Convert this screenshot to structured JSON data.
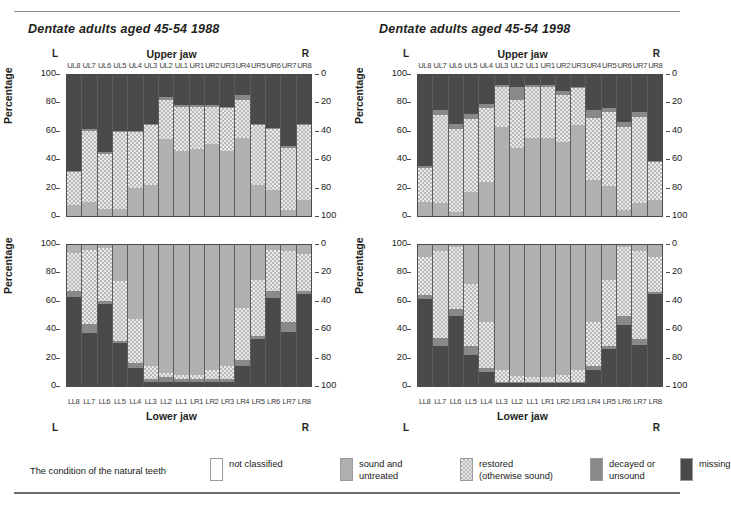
{
  "page": {
    "ghost_header": "",
    "legend_caption": "The condition of the natural teeth"
  },
  "panels": {
    "left": {
      "title": "Dentate adults aged 45-54 1988"
    },
    "right": {
      "title": "Dentate adults aged 45-54 1998"
    }
  },
  "axis": {
    "y_title": "Percentage",
    "left_ticks": [
      "100",
      "80",
      "60",
      "40",
      "20",
      "0"
    ],
    "right_ticks": [
      "0",
      "20",
      "40",
      "60",
      "80",
      "100"
    ],
    "upper_jaw_label": "Upper jaw",
    "lower_jaw_label": "Lower jaw",
    "left_marker": "L",
    "right_marker": "R",
    "upper_teeth": [
      "UL8",
      "UL7",
      "UL6",
      "UL5",
      "UL4",
      "UL3",
      "UL2",
      "UL1",
      "UR1",
      "UR2",
      "UR3",
      "UR4",
      "UR5",
      "UR6",
      "UR7",
      "UR8"
    ],
    "lower_teeth": [
      "LL8",
      "LL7",
      "LL6",
      "LL5",
      "LL4",
      "LL3",
      "LL2",
      "LL1",
      "LR1",
      "LR2",
      "LR3",
      "LR4",
      "LR5",
      "LR6",
      "LR7",
      "LR8"
    ]
  },
  "legend": {
    "items": [
      {
        "label": "not classified",
        "key": "notclassified",
        "color": "#ffffff"
      },
      {
        "label": "sound and\nuntreated",
        "key": "sound",
        "color": "#b0b0b0"
      },
      {
        "label": "restored\n(otherwise sound)",
        "key": "restored",
        "color": "#dcdcdc"
      },
      {
        "label": "decayed or\nunsound",
        "key": "decayed",
        "color": "#898989"
      },
      {
        "label": "missing",
        "key": "missing",
        "color": "#4a4a4a"
      }
    ]
  },
  "chart_data": [
    {
      "id": "upper-1988",
      "type": "bar",
      "subtype": "stacked-100-percent",
      "title": "Dentate adults aged 45-54 1988",
      "panel": "left",
      "xlabel": "Upper jaw",
      "ylabel": "Percentage",
      "ylim": [
        0,
        100
      ],
      "grid": false,
      "legend_position": "figure-bottom",
      "categories": [
        "UL8",
        "UL7",
        "UL6",
        "UL5",
        "UL4",
        "UL3",
        "UL2",
        "UL1",
        "UR1",
        "UR2",
        "UR3",
        "UR4",
        "UR5",
        "UR6",
        "UR7",
        "UR8"
      ],
      "series": [
        {
          "name": "sound and untreated",
          "values": [
            8,
            10,
            5,
            5,
            20,
            22,
            54,
            46,
            47,
            51,
            46,
            55,
            22,
            18,
            4,
            11,
            8
          ]
        },
        {
          "name": "restored (otherwise sound)",
          "values": [
            23,
            50,
            39,
            54,
            39,
            42,
            28,
            31,
            30,
            26,
            30,
            27,
            42,
            43,
            44,
            53,
            25
          ]
        },
        {
          "name": "decayed or unsound",
          "values": [
            1,
            1,
            1,
            1,
            1,
            1,
            2,
            1,
            1,
            1,
            1,
            3,
            1,
            1,
            1,
            1,
            1
          ]
        },
        {
          "name": "missing",
          "values": [
            68,
            39,
            55,
            40,
            40,
            35,
            16,
            22,
            22,
            22,
            23,
            15,
            35,
            38,
            51,
            35,
            66
          ]
        }
      ],
      "series_normalized_note": "values are percentages summing to 100 per tooth"
    },
    {
      "id": "lower-1988",
      "type": "bar",
      "subtype": "stacked-100-percent",
      "title": "Dentate adults aged 45-54 1988",
      "panel": "left",
      "xlabel": "Lower jaw",
      "ylabel": "Percentage",
      "ylim": [
        0,
        100
      ],
      "grid": false,
      "categories": [
        "LL8",
        "LL7",
        "LL6",
        "LL5",
        "LL4",
        "LL3",
        "LL2",
        "LL1",
        "LR1",
        "LR2",
        "LR3",
        "LR4",
        "LR5",
        "LR6",
        "LR7",
        "LR8"
      ],
      "series": [
        {
          "name": "missing",
          "values": [
            63,
            37,
            58,
            30,
            13,
            3,
            3,
            3,
            3,
            3,
            3,
            14,
            33,
            62,
            38,
            65
          ]
        },
        {
          "name": "decayed or unsound",
          "values": [
            4,
            7,
            2,
            2,
            3,
            2,
            3,
            2,
            2,
            2,
            2,
            4,
            2,
            5,
            7,
            2
          ]
        },
        {
          "name": "restored (otherwise sound)",
          "values": [
            27,
            52,
            37,
            42,
            31,
            9,
            3,
            3,
            3,
            6,
            9,
            37,
            40,
            29,
            50,
            26
          ]
        },
        {
          "name": "sound and untreated",
          "values": [
            6,
            4,
            3,
            26,
            53,
            86,
            91,
            92,
            92,
            89,
            86,
            45,
            25,
            4,
            5,
            7
          ]
        }
      ]
    },
    {
      "id": "upper-1998",
      "type": "bar",
      "subtype": "stacked-100-percent",
      "title": "Dentate adults aged 45-54 1998",
      "panel": "right",
      "xlabel": "Upper jaw",
      "ylabel": "Percentage",
      "ylim": [
        0,
        100
      ],
      "grid": false,
      "categories": [
        "UL8",
        "UL7",
        "UL6",
        "UL5",
        "UL4",
        "UL3",
        "UL2",
        "UL1",
        "UR1",
        "UR2",
        "UR3",
        "UR4",
        "UR5",
        "UR6",
        "UR7",
        "UR8"
      ],
      "series": [
        {
          "name": "sound and untreated",
          "values": [
            10,
            9,
            3,
            17,
            24,
            63,
            48,
            55,
            55,
            52,
            64,
            25,
            21,
            4,
            9,
            11
          ]
        },
        {
          "name": "restored (otherwise sound)",
          "values": [
            24,
            62,
            58,
            51,
            52,
            28,
            34,
            36,
            36,
            33,
            26,
            44,
            52,
            59,
            61,
            27
          ]
        },
        {
          "name": "decayed or unsound",
          "values": [
            1,
            4,
            4,
            4,
            3,
            1,
            9,
            1,
            1,
            3,
            1,
            6,
            3,
            3,
            3,
            1
          ]
        },
        {
          "name": "missing",
          "values": [
            65,
            25,
            35,
            28,
            21,
            8,
            9,
            8,
            8,
            12,
            9,
            25,
            24,
            34,
            27,
            61
          ]
        }
      ]
    },
    {
      "id": "lower-1998",
      "type": "bar",
      "subtype": "stacked-100-percent",
      "title": "Dentate adults aged 45-54 1998",
      "panel": "right",
      "xlabel": "Lower jaw",
      "ylabel": "Percentage",
      "ylim": [
        0,
        100
      ],
      "grid": false,
      "categories": [
        "LL8",
        "LL7",
        "LL6",
        "LL5",
        "LL4",
        "LL3",
        "LL2",
        "LL1",
        "LR1",
        "LR2",
        "LR3",
        "LR4",
        "LR5",
        "LR6",
        "LR7",
        "LR8"
      ],
      "series": [
        {
          "name": "missing",
          "values": [
            61,
            28,
            49,
            22,
            10,
            2,
            2,
            2,
            2,
            2,
            2,
            11,
            26,
            43,
            29,
            65
          ]
        },
        {
          "name": "decayed or unsound",
          "values": [
            3,
            6,
            5,
            6,
            3,
            1,
            1,
            1,
            1,
            1,
            1,
            3,
            2,
            6,
            4,
            1
          ]
        },
        {
          "name": "restored (otherwise sound)",
          "values": [
            27,
            61,
            44,
            44,
            32,
            8,
            4,
            3,
            3,
            5,
            8,
            31,
            47,
            49,
            62,
            25
          ]
        },
        {
          "name": "sound and untreated",
          "values": [
            9,
            5,
            2,
            28,
            55,
            89,
            93,
            94,
            94,
            92,
            89,
            55,
            25,
            2,
            5,
            9
          ]
        }
      ]
    }
  ]
}
